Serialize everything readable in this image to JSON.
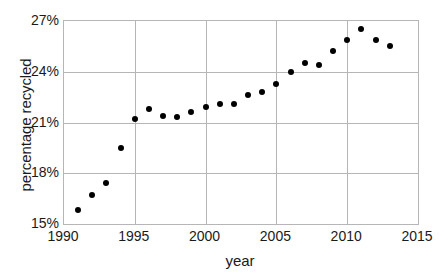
{
  "chart_data": {
    "type": "scatter",
    "title": "",
    "xlabel": "year",
    "ylabel": "percentage recycled",
    "xlim": [
      1990,
      2015
    ],
    "ylim": [
      15,
      27
    ],
    "xticks": [
      1990,
      1995,
      2000,
      2005,
      2010,
      2015
    ],
    "xticklabels": [
      "1990",
      "1995",
      "2000",
      "2005",
      "2010",
      "2015"
    ],
    "yticks": [
      15,
      18,
      21,
      24,
      27
    ],
    "yticklabels": [
      "15%",
      "18%",
      "21%",
      "24%",
      "27%"
    ],
    "grid": "both",
    "legend": "none",
    "marker": "filled-circle",
    "marker_color": "#000000",
    "x": [
      1991,
      1992,
      1993,
      1994,
      1995,
      1996,
      1997,
      1998,
      1999,
      2000,
      2001,
      2002,
      2003,
      2004,
      2005,
      2006,
      2007,
      2008,
      2009,
      2010,
      2011,
      2012,
      2013
    ],
    "values": [
      15.8,
      16.7,
      17.4,
      19.5,
      21.2,
      21.8,
      21.4,
      21.3,
      21.6,
      21.9,
      22.1,
      22.1,
      22.6,
      22.8,
      23.3,
      24.0,
      24.5,
      24.4,
      25.2,
      25.9,
      26.5,
      25.9,
      25.5
    ],
    "series": [
      {
        "name": "percentage recycled",
        "points": [
          {
            "year": 1991,
            "value": 15.8
          },
          {
            "year": 1992,
            "value": 16.7
          },
          {
            "year": 1993,
            "value": 17.4
          },
          {
            "year": 1994,
            "value": 19.5
          },
          {
            "year": 1995,
            "value": 21.2
          },
          {
            "year": 1996,
            "value": 21.8
          },
          {
            "year": 1997,
            "value": 21.4
          },
          {
            "year": 1998,
            "value": 21.3
          },
          {
            "year": 1999,
            "value": 21.6
          },
          {
            "year": 2000,
            "value": 21.9
          },
          {
            "year": 2001,
            "value": 22.1
          },
          {
            "year": 2002,
            "value": 22.1
          },
          {
            "year": 2003,
            "value": 22.6
          },
          {
            "year": 2004,
            "value": 22.8
          },
          {
            "year": 2005,
            "value": 23.3
          },
          {
            "year": 2006,
            "value": 24.0
          },
          {
            "year": 2007,
            "value": 24.5
          },
          {
            "year": 2008,
            "value": 24.4
          },
          {
            "year": 2009,
            "value": 25.2
          },
          {
            "year": 2010,
            "value": 25.9
          },
          {
            "year": 2011,
            "value": 26.5
          },
          {
            "year": 2012,
            "value": 25.9
          },
          {
            "year": 2013,
            "value": 25.5
          }
        ]
      }
    ]
  },
  "style": {
    "grid_color": "#b6b6b6",
    "axis_color": "#b6b6b6",
    "text_color": "#1a1a1a",
    "background": "#ffffff"
  }
}
